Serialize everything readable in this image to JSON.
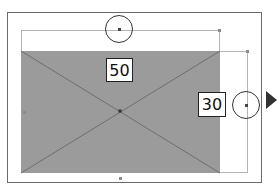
{
  "diagram": {
    "type": "rectangle-resize-dimension-editor",
    "rectangle": {
      "fill_color": "#9b9b9b",
      "has_diagonals": true
    },
    "dimensions": {
      "width_label": "50",
      "height_label": "30"
    },
    "handles": {
      "top_circle": "width-drag-handle",
      "right_circle": "height-drag-handle",
      "center": "center-handle",
      "bottom": "bottom-edge-handle",
      "left": "left-edge-handle"
    },
    "arrow": {
      "direction": "right",
      "color": "#333333"
    },
    "frame_color": "#6a6a6a"
  }
}
